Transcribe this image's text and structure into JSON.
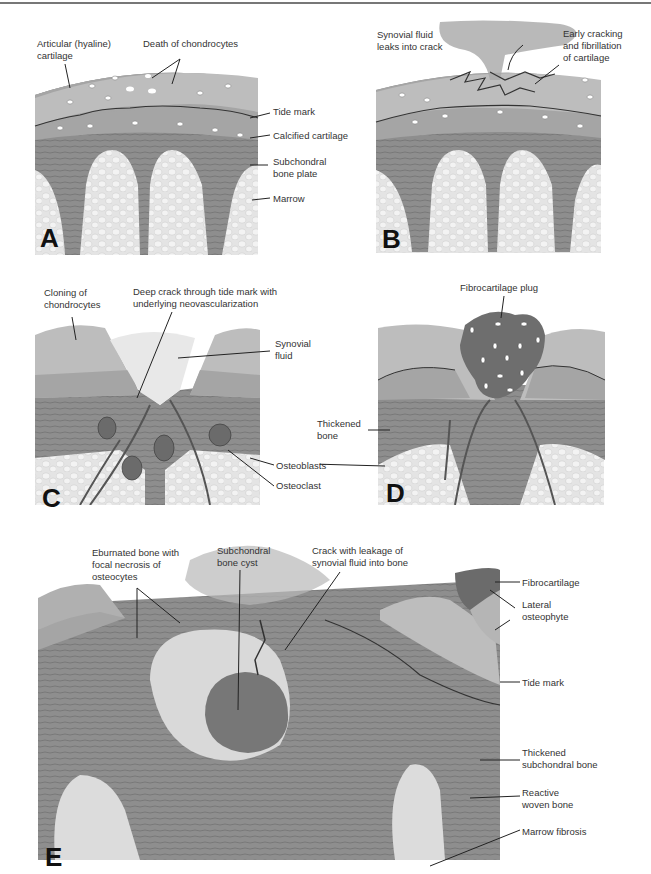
{
  "figure": {
    "panels": [
      {
        "id": "A",
        "letter": "A",
        "labels": {
          "articular_cartilage": "Articular (hyaline)\ncartilage",
          "death_chondrocytes": "Death of chondrocytes",
          "tide_mark": "Tide mark",
          "calcified_cartilage": "Calcified cartilage",
          "subchondral_plate": "Subchondral\nbone plate",
          "marrow": "Marrow"
        }
      },
      {
        "id": "B",
        "letter": "B",
        "labels": {
          "synovial_leak": "Synovial fluid\nleaks into crack",
          "early_cracking": "Early cracking\nand fibrillation\nof cartilage"
        }
      },
      {
        "id": "C",
        "letter": "C",
        "labels": {
          "cloning": "Cloning of\nchondrocytes",
          "deep_crack": "Deep crack through tide mark with\nunderlying neovascularization",
          "synovial_fluid": "Synovial\nfluid",
          "osteoblasts": "Osteoblasts",
          "osteoclast": "Osteoclast"
        }
      },
      {
        "id": "D",
        "letter": "D",
        "labels": {
          "fibrocartilage_plug": "Fibrocartilage plug",
          "thickened_bone": "Thickened\nbone"
        }
      },
      {
        "id": "E",
        "letter": "E",
        "labels": {
          "eburnated_bone": "Eburnated bone with\nfocal necrosis of\nosteocytes",
          "bone_cyst": "Subchondral\nbone cyst",
          "crack_leakage": "Crack with leakage of\nsynovial fluid into bone",
          "fibrocartilage": "Fibrocartilage",
          "lateral_osteophyte": "Lateral\nosteophyte",
          "tide_mark": "Tide mark",
          "thickened_subchondral": "Thickened\nsubchondral bone",
          "reactive_woven": "Reactive\nwoven bone",
          "marrow_fibrosis": "Marrow fibrosis"
        }
      }
    ],
    "colors": {
      "cartilage": "#b9b9b9",
      "calcified": "#a4a4a4",
      "bone": "#8c8c8c",
      "marrow": "#e2e2e2",
      "plug": "#6e6e6e",
      "label_text": "#333333",
      "leader_line": "#222222"
    }
  }
}
